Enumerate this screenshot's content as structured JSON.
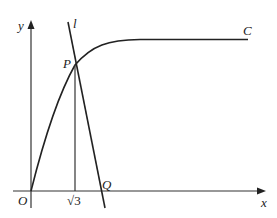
{
  "diagram": {
    "axes": {
      "x_label": "x",
      "y_label": "y",
      "origin_label": "O"
    },
    "curve": {
      "label": "C"
    },
    "line": {
      "label": "l"
    },
    "points": {
      "P": {
        "label": "P"
      },
      "Q": {
        "label": "Q"
      }
    },
    "x_tick": {
      "label": "√3"
    },
    "colors": {
      "stroke": "#222222",
      "axis": "#333333",
      "background": "#ffffff"
    }
  }
}
